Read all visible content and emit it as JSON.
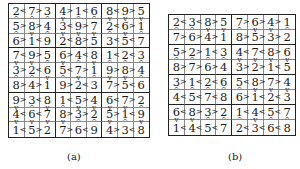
{
  "figures": [
    {
      "id": "a",
      "caption": "(a)",
      "size": 9,
      "box_rows": 3,
      "box_cols": 3,
      "rows": [
        {
          "cells": [
            "2",
            "7",
            "3",
            "4",
            "1",
            "6",
            "8",
            "9",
            "5"
          ],
          "h": [
            "<",
            ">",
            "",
            ">",
            "<",
            "",
            "<",
            ">"
          ]
        },
        {
          "cells": [
            "5",
            "8",
            "4",
            "3",
            "9",
            "7",
            "2",
            "6",
            "1"
          ],
          "h": [
            ">",
            ">",
            "",
            "<",
            ">",
            "",
            "<",
            ">"
          ]
        },
        {
          "cells": [
            "6",
            "1",
            "9",
            "2",
            "8",
            "5",
            "3",
            "5",
            "7"
          ],
          "h": [
            ">",
            "<",
            "",
            "<",
            ">",
            "",
            "<",
            "<"
          ]
        },
        {
          "cells": [
            "7",
            "9",
            "5",
            "6",
            "4",
            "8",
            "1",
            "2",
            "3"
          ],
          "h": [
            "<",
            ">",
            "",
            ">",
            "<",
            "",
            "<",
            "<"
          ]
        },
        {
          "cells": [
            "3",
            "2",
            "6",
            "5",
            "7",
            "1",
            "9",
            "8",
            "4"
          ],
          "h": [
            ">",
            "<",
            "",
            "<",
            ">",
            "",
            ">",
            ">"
          ]
        },
        {
          "cells": [
            "8",
            "4",
            "1",
            "9",
            "2",
            "3",
            "7",
            "5",
            "6"
          ],
          "h": [
            ">",
            ">",
            "",
            ">",
            "<",
            "",
            ">",
            "<"
          ]
        },
        {
          "cells": [
            "9",
            "3",
            "8",
            "1",
            "5",
            "4",
            "6",
            "7",
            "2"
          ],
          "h": [
            ">",
            "<",
            "",
            "<",
            ">",
            "",
            "<",
            ">"
          ]
        },
        {
          "cells": [
            "4",
            "6",
            "7",
            "8",
            "3",
            "2",
            "5",
            "1",
            "9"
          ],
          "h": [
            "<",
            "<",
            "",
            ">",
            ">",
            "",
            ">",
            "<"
          ]
        },
        {
          "cells": [
            "1",
            "5",
            "2",
            "7",
            "6",
            "9",
            "4",
            "3",
            "8"
          ],
          "h": [
            "<",
            ">",
            "",
            ">",
            "<",
            "",
            ">",
            "<"
          ]
        }
      ]
    },
    {
      "id": "b",
      "caption": "(b)",
      "size": 8,
      "box_rows": 2,
      "box_cols": 4,
      "rows": [
        {
          "cells": [
            "2",
            "3",
            "8",
            "5",
            "7",
            "6",
            "4",
            "1"
          ],
          "h": [
            "<",
            "<",
            ">",
            "",
            ">",
            ">",
            ">"
          ]
        },
        {
          "cells": [
            "7",
            "6",
            "4",
            "1",
            "8",
            "5",
            "3",
            "2"
          ],
          "h": [
            ">",
            ">",
            ">",
            "",
            ">",
            ">",
            ">"
          ]
        },
        {
          "cells": [
            "5",
            "2",
            "1",
            "3",
            "4",
            "7",
            "8",
            "6"
          ],
          "h": [
            ">",
            ">",
            "<",
            "",
            "<",
            "<",
            ">"
          ]
        },
        {
          "cells": [
            "8",
            "7",
            "6",
            "4",
            "3",
            "2",
            "1",
            "5"
          ],
          "h": [
            ">",
            ">",
            ">",
            "",
            ">",
            ">",
            "<"
          ]
        },
        {
          "cells": [
            "3",
            "1",
            "2",
            "6",
            "5",
            "8",
            "7",
            "4"
          ],
          "h": [
            ">",
            "<",
            "<",
            "",
            "<",
            ">",
            ">"
          ]
        },
        {
          "cells": [
            "4",
            "5",
            "7",
            "8",
            "6",
            "1",
            "2",
            "3"
          ],
          "h": [
            "<",
            "<",
            "<",
            "",
            ">",
            "<",
            "<"
          ]
        },
        {
          "cells": [
            "6",
            "8",
            "3",
            "2",
            "1",
            "4",
            "5",
            "7"
          ],
          "h": [
            "<",
            ">",
            ">",
            "",
            "<",
            "<",
            "<"
          ]
        },
        {
          "cells": [
            "1",
            "4",
            "5",
            "7",
            "2",
            "3",
            "6",
            "8"
          ],
          "h": [
            "<",
            "<",
            "<",
            "",
            "<",
            "<",
            "<"
          ]
        }
      ]
    }
  ]
}
